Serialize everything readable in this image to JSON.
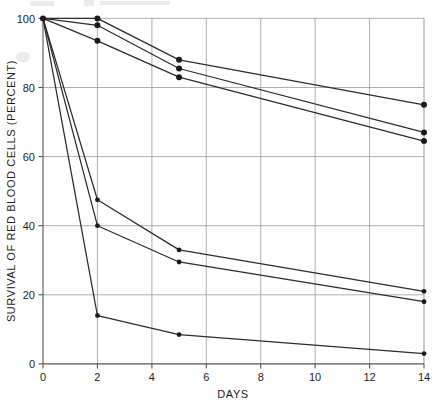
{
  "chart_data": {
    "type": "line",
    "title": "",
    "subtitle": "",
    "xlabel": "DAYS",
    "ylabel": "SURVIVAL OF RED BLOOD CELLS (PERCENT)",
    "xlim": [
      0,
      14
    ],
    "ylim": [
      0,
      100
    ],
    "xticks": [
      0,
      2,
      4,
      6,
      8,
      10,
      12,
      14
    ],
    "xtick_labels": [
      "0",
      "2",
      "4",
      "6",
      "8",
      "10",
      "12",
      "14"
    ],
    "yticks": [
      0,
      20,
      40,
      60,
      80,
      100
    ],
    "ytick_labels": [
      "0",
      "20",
      "40",
      "60",
      "80",
      "100"
    ],
    "grid": true,
    "grid_axis": "y-and-x",
    "legend": "none",
    "marker": "filled-circle",
    "x": [
      0,
      2,
      5,
      14
    ],
    "series": [
      {
        "name": "series-1",
        "values": [
          100,
          100,
          88,
          75
        ]
      },
      {
        "name": "series-2",
        "values": [
          100,
          98,
          85.5,
          67
        ]
      },
      {
        "name": "series-3",
        "values": [
          100,
          93.5,
          83,
          64.5
        ]
      },
      {
        "name": "series-4",
        "values": [
          100,
          47.5,
          33,
          21
        ]
      },
      {
        "name": "series-5",
        "values": [
          100,
          40,
          29.5,
          18
        ]
      },
      {
        "name": "series-6",
        "values": [
          100,
          14,
          8.5,
          3
        ]
      }
    ]
  },
  "axes": {
    "x_axis_name": "DAYS",
    "y_axis_name": "SURVIVAL OF RED BLOOD CELLS (PERCENT)"
  }
}
